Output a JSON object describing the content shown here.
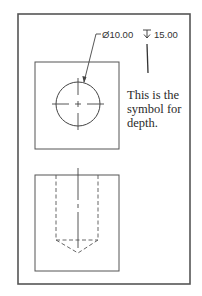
{
  "diagram": {
    "type": "orthographic-engineering-drawing",
    "views": [
      "top-view",
      "front-section-view"
    ],
    "dimension": {
      "diameter_symbol": "Ø",
      "diameter_value": "10.00",
      "diameter_label": "Ø10.00",
      "depth_symbol": "↧",
      "depth_value": "15.00",
      "depth_label": "15.00"
    },
    "annotation": {
      "lines": [
        "This is the",
        "symbol for",
        "depth."
      ]
    },
    "colors": {
      "line": "#444444",
      "frame": "#555555",
      "background": "#ffffff"
    }
  }
}
